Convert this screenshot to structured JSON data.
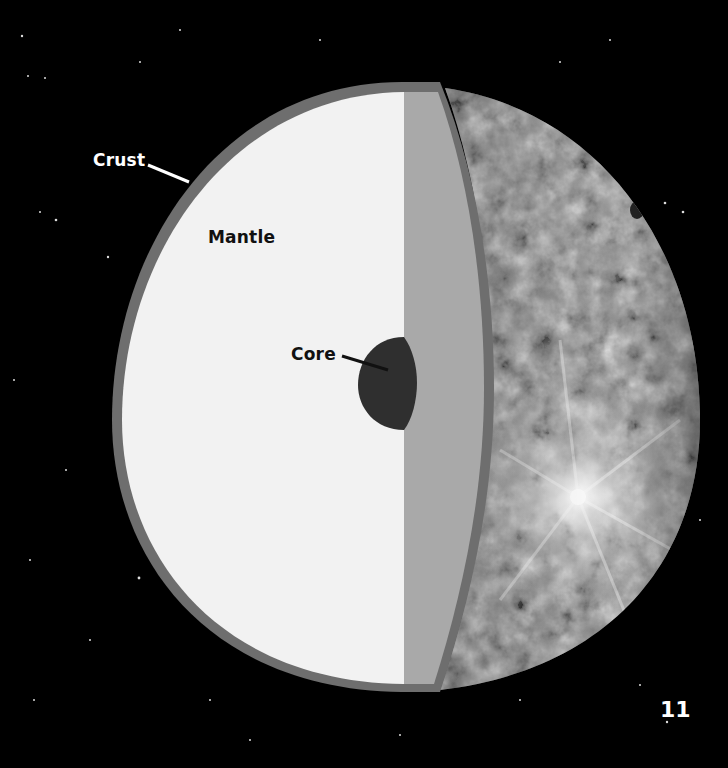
{
  "diagram": {
    "layers": [
      {
        "name": "Crust",
        "label": "Crust",
        "color": "#6e6e6e"
      },
      {
        "name": "Mantle",
        "label": "Mantle",
        "color": "#f2f2f2"
      },
      {
        "name": "Core",
        "label": "Core",
        "color": "#2f2f2f"
      }
    ],
    "labels": {
      "crust": "Crust",
      "mantle": "Mantle",
      "core": "Core"
    },
    "colors": {
      "background": "#000000",
      "crust": "#6e6e6e",
      "mantle": "#f2f2f2",
      "cut_face": "#a9a9a9",
      "core": "#2f2f2f",
      "surface_base": "#8c8c8c"
    }
  },
  "page": {
    "number": "11"
  }
}
